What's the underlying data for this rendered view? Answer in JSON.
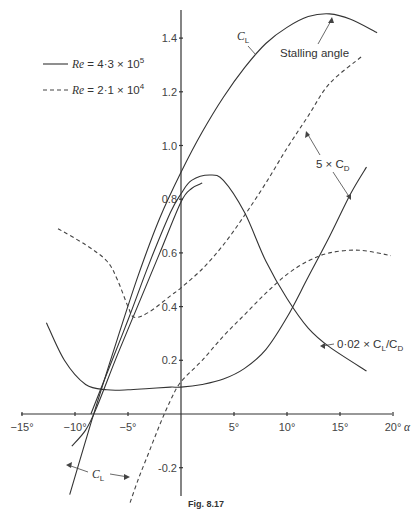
{
  "chart_data": {
    "type": "line",
    "title": "",
    "caption": "Fig. 8.17",
    "xlabel": "α",
    "ylabel": "",
    "xlim": [
      -15,
      20
    ],
    "ylim": [
      -0.3,
      1.5
    ],
    "grid": false,
    "legend_position": "upper left",
    "x_ticks": [
      {
        "value": -15,
        "label": "−15°"
      },
      {
        "value": -10,
        "label": "−10°"
      },
      {
        "value": -5,
        "label": "−5°"
      },
      {
        "value": 5,
        "label": "5°"
      },
      {
        "value": 10,
        "label": "10°"
      },
      {
        "value": 15,
        "label": "15°"
      },
      {
        "value": 20,
        "label": "20°"
      }
    ],
    "y_ticks": [
      {
        "value": 1.4,
        "label": "1.4"
      },
      {
        "value": 1.2,
        "label": "1.2"
      },
      {
        "value": 1.0,
        "label": "1.0"
      },
      {
        "value": 0.8,
        "label": "0.8"
      },
      {
        "value": 0.6,
        "label": "0.6"
      },
      {
        "value": 0.4,
        "label": "0.4"
      },
      {
        "value": 0.2,
        "label": "0.2"
      },
      {
        "value": -0.2,
        "label": "-0.2"
      }
    ],
    "legend": [
      {
        "style": "solid",
        "label_prefix": "Re",
        "label_value": "= 4·3 × 10",
        "exponent": "5"
      },
      {
        "style": "dashed",
        "label_prefix": "Re",
        "label_value": "= 2·1 × 10",
        "exponent": "4"
      }
    ],
    "series": [
      {
        "name": "C_L (Re = 4.3×10^5)",
        "style": "solid",
        "x": [
          -10.5,
          -9,
          -8,
          -6,
          -4,
          -2,
          0,
          2,
          4,
          6,
          8,
          10,
          12,
          14,
          16,
          18.5
        ],
        "y": [
          -0.3,
          -0.1,
          0.03,
          0.28,
          0.52,
          0.73,
          0.9,
          1.05,
          1.18,
          1.29,
          1.38,
          1.44,
          1.48,
          1.49,
          1.47,
          1.42
        ]
      },
      {
        "name": "C_L (Re = 2.1×10^4)",
        "style": "solid",
        "x": [
          -10.3,
          -9,
          -8,
          -6,
          -4,
          -2,
          0,
          1,
          2
        ],
        "y": [
          -0.12,
          -0.06,
          0.02,
          0.22,
          0.41,
          0.6,
          0.79,
          0.84,
          0.86
        ]
      },
      {
        "name": "5 × C_D (Re = 4.3×10^5)",
        "style": "solid",
        "x": [
          -12.7,
          -11,
          -9,
          -7,
          -5,
          -3,
          -1,
          0,
          2,
          4,
          6,
          8,
          10,
          12,
          14,
          16,
          17.5
        ],
        "y": [
          0.34,
          0.2,
          0.11,
          0.09,
          0.09,
          0.095,
          0.1,
          0.1,
          0.11,
          0.13,
          0.17,
          0.24,
          0.36,
          0.51,
          0.66,
          0.82,
          0.92
        ]
      },
      {
        "name": "5 × C_D (Re = 2.1×10^4)",
        "style": "dashed",
        "x": [
          -11.6,
          -9,
          -7,
          -6,
          -5,
          -4.4,
          -3,
          -1,
          0,
          2,
          4,
          6,
          8,
          10,
          12,
          14,
          17
        ],
        "y": [
          0.69,
          0.63,
          0.57,
          0.5,
          0.4,
          0.36,
          0.38,
          0.44,
          0.47,
          0.54,
          0.63,
          0.74,
          0.86,
          0.99,
          1.11,
          1.23,
          1.33
        ]
      },
      {
        "name": "0.02 × C_L/C_D (Re = 4.3×10^5)",
        "style": "solid",
        "x": [
          -8.5,
          -7,
          -5,
          -3,
          -1,
          0,
          1,
          2.7,
          4,
          6,
          8,
          10,
          12,
          14,
          17.5
        ],
        "y": [
          0.0,
          0.15,
          0.35,
          0.56,
          0.75,
          0.82,
          0.87,
          0.89,
          0.87,
          0.75,
          0.57,
          0.43,
          0.32,
          0.25,
          0.16
        ]
      },
      {
        "name": "0.02 × C_L/C_D (Re = 2.1×10^4)",
        "style": "dashed",
        "x": [
          -4.8,
          -4,
          -3,
          -2,
          -1,
          0,
          2,
          4,
          6,
          8,
          10,
          12,
          14,
          16.8,
          19.8
        ],
        "y": [
          -0.33,
          -0.24,
          -0.14,
          -0.04,
          0.05,
          0.12,
          0.2,
          0.29,
          0.37,
          0.45,
          0.52,
          0.57,
          0.6,
          0.61,
          0.59
        ]
      }
    ],
    "annotations": [
      {
        "id": "cl_top",
        "text": "C",
        "sub": "L"
      },
      {
        "id": "stall",
        "text": "Stalling angle"
      },
      {
        "id": "cd",
        "text": "5 × C",
        "sub": "D"
      },
      {
        "id": "ld",
        "text": "0·02 × C",
        "sub": "L",
        "text2": "/C",
        "sub2": "D"
      },
      {
        "id": "cl_bottom",
        "text": "C",
        "sub": "L"
      }
    ]
  },
  "labels": {
    "x_axis_symbol": "α",
    "caption": "Fig. 8.17",
    "legend_solid_re": "Re",
    "legend_solid_eq": " = 4·3 × 10",
    "legend_solid_exp": "5",
    "legend_dashed_re": "Re",
    "legend_dashed_eq": " = 2·1 × 10",
    "legend_dashed_exp": "4",
    "cl_top": "C",
    "cl_top_sub": "L",
    "stall": "Stalling angle",
    "cd_prefix": "5 × C",
    "cd_sub": "D",
    "ld_prefix": "0·02 × C",
    "ld_sub1": "L",
    "ld_mid": "/C",
    "ld_sub2": "D",
    "cl_bottom": "C",
    "cl_bottom_sub": "L"
  }
}
